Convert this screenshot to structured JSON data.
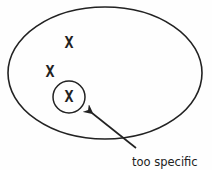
{
  "diagram": {
    "outer_region": {
      "shape": "ellipse",
      "cx": 105,
      "cy": 73,
      "rx": 97,
      "ry": 66
    },
    "points": [
      {
        "label": "X",
        "x": 69,
        "y": 43
      },
      {
        "label": "X",
        "x": 50,
        "y": 72
      },
      {
        "label": "X",
        "x": 69,
        "y": 97
      }
    ],
    "inner_region": {
      "shape": "circle",
      "cx": 69,
      "cy": 97,
      "r": 16
    },
    "annotation": {
      "text": "too specific",
      "arrow_from": [
        136,
        148
      ],
      "arrow_to": [
        89,
        111
      ]
    },
    "stroke_color": "#222222"
  }
}
